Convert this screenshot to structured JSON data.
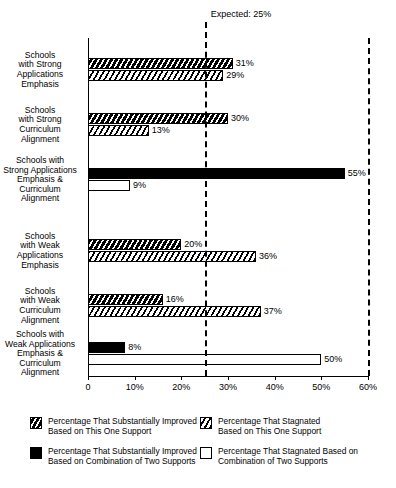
{
  "chart_data": {
    "type": "bar",
    "orientation": "horizontal",
    "title": "",
    "xlabel": "",
    "ylabel": "",
    "xlim": [
      0,
      60
    ],
    "xticks": [
      0,
      10,
      20,
      30,
      40,
      50,
      60
    ],
    "xticklabels": [
      "0",
      "10%",
      "20%",
      "30%",
      "40%",
      "50%",
      "60%"
    ],
    "grid": false,
    "legend_position": "bottom",
    "annotations": [
      {
        "name": "expected-line",
        "label": "Expected: 25%",
        "value": 25,
        "style": "dashed-vertical"
      },
      {
        "name": "axis-max-line",
        "label": "",
        "value": 60,
        "style": "dashed-vertical"
      }
    ],
    "categories": [
      "Schools with Strong Applications Emphasis",
      "Schools with Strong Curriculum Alignment",
      "Schools with Strong Applications Emphasis & Curriculum Alignment",
      "Schools with Weak Applications Emphasis",
      "Schools with Weak Curriculum Alignment",
      "Schools with Weak Applications Emphasis & Curriculum Alignment"
    ],
    "series": [
      {
        "name": "Percentage That Substantially Improved Based on This One Support",
        "pattern": "dark-hatch",
        "values": [
          31,
          30,
          null,
          20,
          16,
          null
        ],
        "value_labels": [
          "31%",
          "30%",
          "",
          "20%",
          "16%",
          ""
        ]
      },
      {
        "name": "Percentage That Stagnated Based on This One Support",
        "pattern": "light-hatch",
        "values": [
          29,
          13,
          null,
          36,
          37,
          null
        ],
        "value_labels": [
          "29%",
          "13%",
          "",
          "36%",
          "37%",
          ""
        ]
      },
      {
        "name": "Percentage That Substantially Improved Based on Combination of Two Supports",
        "pattern": "solid-black",
        "values": [
          null,
          null,
          55,
          null,
          null,
          8
        ],
        "value_labels": [
          "",
          "",
          "55%",
          "",
          "",
          "8%"
        ]
      },
      {
        "name": "Percentage That Stagnated Based on Combination of Two Supports",
        "pattern": "outline",
        "values": [
          null,
          null,
          9,
          null,
          null,
          50
        ],
        "value_labels": [
          "",
          "",
          "9%",
          "",
          "",
          "50%"
        ]
      }
    ]
  },
  "category_labels": [
    {
      "lines": [
        "Schools",
        "with Strong",
        "Applications",
        "Emphasis"
      ]
    },
    {
      "lines": [
        "Schools",
        "with Strong",
        "Curriculum",
        "Alignment"
      ]
    },
    {
      "lines": [
        "Schools with",
        "Strong Applications",
        "Emphasis &",
        "Curriculum",
        "Alignment"
      ]
    },
    {
      "lines": [
        "Schools",
        "with Weak",
        "Applications",
        "Emphasis"
      ]
    },
    {
      "lines": [
        "Schools",
        "with Weak",
        "Curriculum",
        "Alignment"
      ]
    },
    {
      "lines": [
        "Schools with",
        "Weak Applications",
        "Emphasis &",
        "Curriculum",
        "Alignment"
      ]
    }
  ],
  "axis": {
    "ticklabels": [
      "0",
      "10%",
      "20%",
      "30%",
      "40%",
      "50%",
      "60%"
    ]
  },
  "expected": {
    "label": "Expected: 25%"
  },
  "bars": [
    {
      "group": 0,
      "row": 0,
      "pattern": "dark-hatch",
      "value": 31,
      "label": "31%"
    },
    {
      "group": 0,
      "row": 1,
      "pattern": "light-hatch",
      "value": 29,
      "label": "29%"
    },
    {
      "group": 1,
      "row": 0,
      "pattern": "dark-hatch",
      "value": 30,
      "label": "30%"
    },
    {
      "group": 1,
      "row": 1,
      "pattern": "light-hatch",
      "value": 13,
      "label": "13%"
    },
    {
      "group": 2,
      "row": 0,
      "pattern": "solid-black",
      "value": 55,
      "label": "55%"
    },
    {
      "group": 2,
      "row": 1,
      "pattern": "outline",
      "value": 9,
      "label": "9%"
    },
    {
      "group": 3,
      "row": 0,
      "pattern": "dark-hatch",
      "value": 20,
      "label": "20%"
    },
    {
      "group": 3,
      "row": 1,
      "pattern": "light-hatch",
      "value": 36,
      "label": "36%"
    },
    {
      "group": 4,
      "row": 0,
      "pattern": "dark-hatch",
      "value": 16,
      "label": "16%"
    },
    {
      "group": 4,
      "row": 1,
      "pattern": "light-hatch",
      "value": 37,
      "label": "37%"
    },
    {
      "group": 5,
      "row": 0,
      "pattern": "solid-black",
      "value": 8,
      "label": "8%"
    },
    {
      "group": 5,
      "row": 1,
      "pattern": "outline",
      "value": 50,
      "label": "50%"
    }
  ],
  "legend": {
    "items": [
      {
        "pattern": "dark-hatch",
        "lines": [
          "Percentage That Substantially Improved",
          "Based on This One Support"
        ]
      },
      {
        "pattern": "light-hatch",
        "lines": [
          "Percentage That Stagnated",
          "Based on This One Support"
        ]
      },
      {
        "pattern": "solid-black",
        "lines": [
          "Percentage That Substantially Improved",
          "Based on Combination of Two Supports"
        ]
      },
      {
        "pattern": "outline",
        "lines": [
          "Percentage That Stagnated Based on",
          "Combination of Two Supports"
        ]
      }
    ]
  }
}
